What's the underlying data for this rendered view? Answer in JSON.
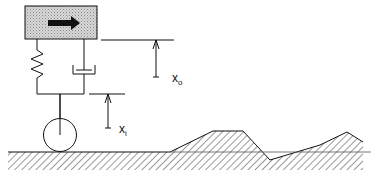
{
  "diagram": {
    "components": {
      "mass": {
        "label": "",
        "fill_pattern": "stippled-gray",
        "arrow": "direction-of-travel-right"
      },
      "spring": {
        "label": ""
      },
      "damper": {
        "label": ""
      },
      "wheel": {
        "label": ""
      },
      "ground": {
        "label": "",
        "pattern": "hatched"
      }
    },
    "labels": {
      "output_displacement": {
        "base": "x",
        "subscript": "o"
      },
      "input_displacement": {
        "base": "x",
        "subscript": "i"
      }
    },
    "colors": {
      "stroke": "#111111",
      "mass_fill": "#c8c8c8",
      "background": "#ffffff"
    }
  }
}
